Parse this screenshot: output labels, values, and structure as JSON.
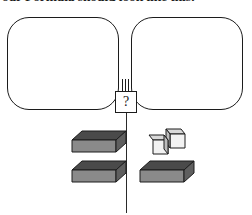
{
  "header": {
    "text": "our Formula should look like this:"
  },
  "balance": {
    "left_pan_label": "left-pan",
    "right_pan_label": "right-pan",
    "unknown_symbol": "?",
    "fulcrum_label": "fulcrum-post",
    "divider_label": "center-divider"
  },
  "colors": {
    "outline": "#1c1c1c",
    "slab_top": "#4a4a4a",
    "slab_front": "#8a8a8a",
    "slab_side": "#5f5f5f",
    "cube_top": "#d9d9d9",
    "cube_front": "#f2f2f2",
    "cube_side": "#bcbcbc",
    "background": "#ffffff"
  },
  "objects": {
    "left_group": [
      {
        "id": "slab-left-top",
        "shape": "slab",
        "count": 1
      },
      {
        "id": "slab-left-bottom",
        "shape": "slab",
        "count": 1
      }
    ],
    "right_group": [
      {
        "id": "cube-pair",
        "shape": "cube",
        "count": 2
      },
      {
        "id": "slab-right-bottom",
        "shape": "slab",
        "count": 1
      }
    ]
  }
}
